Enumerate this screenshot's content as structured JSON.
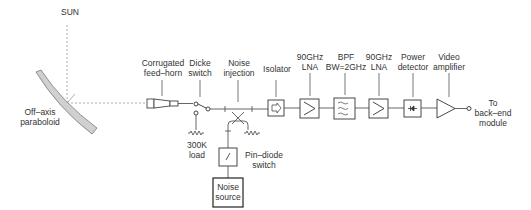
{
  "labels": {
    "sun": "SUN",
    "paraboloid": "Off–axis\nparaboloid",
    "feed_horn": "Corrugated\nfeed–horn",
    "dicke_switch": "Dicke\nswitch",
    "noise_injection": "Noise\ninjection",
    "isolator": "Isolator",
    "lna1": "90GHz\nLNA",
    "bpf": "BPF\nBW=2GHz",
    "lna2": "90GHz\nLNA",
    "power_detector": "Power\ndetector",
    "video_amplifier": "Video\namplifier",
    "output": "To\nback–end\nmodule",
    "load": "300K\nload",
    "pin_diode": "Pin–diode\nswitch",
    "noise_source": "Noise\nsource"
  },
  "colors": {
    "line": "#555555",
    "dashed": "#888888",
    "mirror_fill": "#d0d0d0",
    "text": "#333333"
  }
}
